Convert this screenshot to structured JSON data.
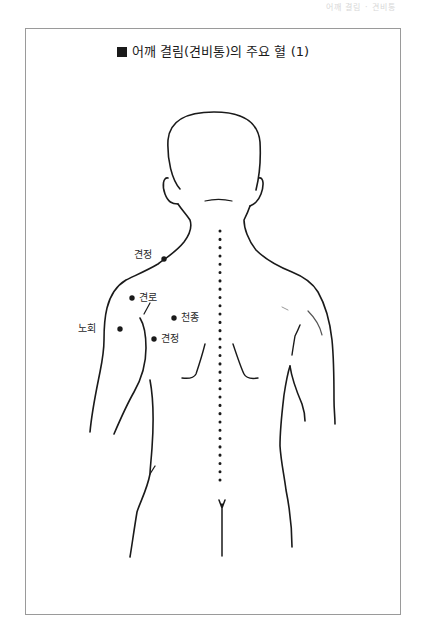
{
  "page_header": "어깨 결림 · 견비통",
  "title": {
    "marker": "black-square",
    "text": "어깨 결림(견비통)의 주요 혈 (1)"
  },
  "figure": {
    "spine_line": "dotted vertical line along the spine"
  },
  "acupoints": [
    {
      "id": "gyeonjeong-upper",
      "label": "견정",
      "label_side": "left",
      "x": 164,
      "y": 259
    },
    {
      "id": "gyeonro",
      "label": "견로",
      "label_side": "right",
      "x": 132,
      "y": 298
    },
    {
      "id": "cheonjong",
      "label": "천종",
      "label_side": "right",
      "x": 174,
      "y": 318
    },
    {
      "id": "nohoe",
      "label": "노회",
      "label_side": "left",
      "x": 120,
      "y": 329
    },
    {
      "id": "gyeonjeong-lower",
      "label": "견정",
      "label_side": "right",
      "x": 154,
      "y": 339
    }
  ],
  "colors": {
    "ink": "#1a1a1a",
    "frame": "#9a9a9a",
    "background": "#ffffff"
  }
}
